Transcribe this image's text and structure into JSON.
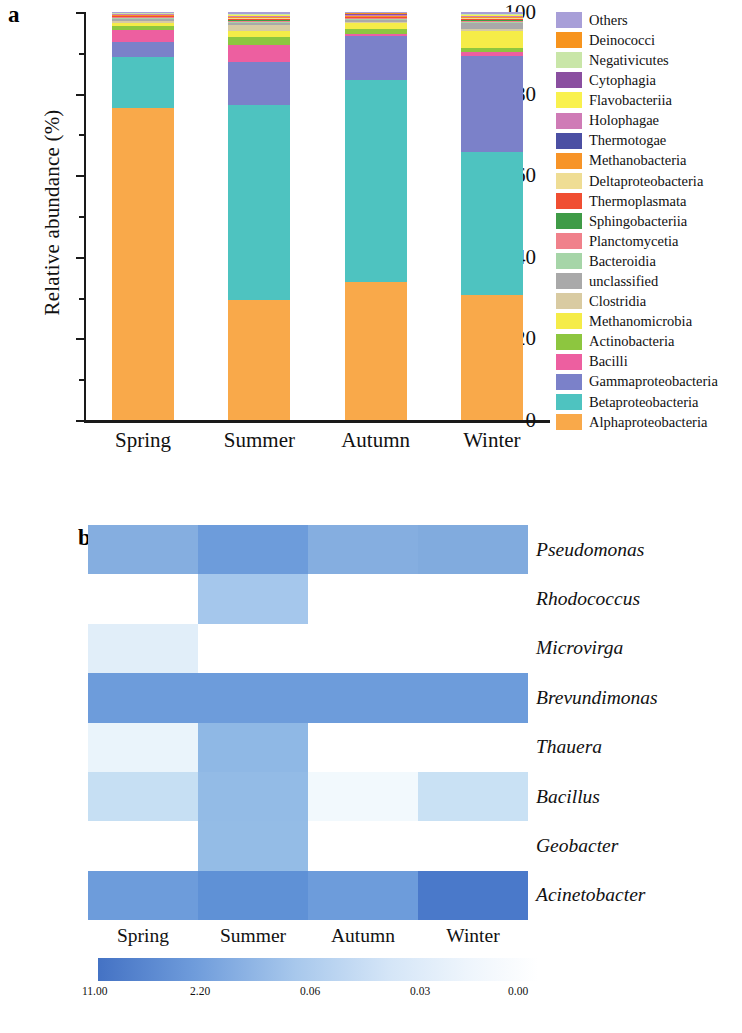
{
  "figure": {
    "panel_a_letter": "a",
    "panel_b_letter": "b"
  },
  "panel_a": {
    "y_axis_title": "Relative abundance (%)",
    "y_ticks": [
      "0",
      "20",
      "40",
      "60",
      "80",
      "100"
    ],
    "x_labels": [
      "Spring",
      "Summer",
      "Autumn",
      "Winter"
    ],
    "legend_title": ""
  },
  "legend": {
    "items": [
      {
        "label": "Others",
        "color": "#a89fd8"
      },
      {
        "label": "Deinococci",
        "color": "#f7941e"
      },
      {
        "label": "Negativicutes",
        "color": "#c9e6a8"
      },
      {
        "label": "Cytophagia",
        "color": "#8a4fa0"
      },
      {
        "label": "Flavobacteriia",
        "color": "#f9f14e"
      },
      {
        "label": "Holophagae",
        "color": "#cf7bb6"
      },
      {
        "label": "Thermotogae",
        "color": "#4b4fa3"
      },
      {
        "label": "Methanobacteria",
        "color": "#f79428"
      },
      {
        "label": "Deltaproteobacteria",
        "color": "#efdd94"
      },
      {
        "label": "Thermoplasmata",
        "color": "#f04e32"
      },
      {
        "label": "Sphingobacteriia",
        "color": "#3f9b47"
      },
      {
        "label": "Planctomycetia",
        "color": "#f0818b"
      },
      {
        "label": "Bacteroidia",
        "color": "#a6d5a8"
      },
      {
        "label": "unclassified",
        "color": "#a9a9a9"
      },
      {
        "label": "Clostridia",
        "color": "#d9cba2"
      },
      {
        "label": "Methanomicrobia",
        "color": "#f5ec48"
      },
      {
        "label": "Actinobacteria",
        "color": "#8dc63f"
      },
      {
        "label": "Bacilli",
        "color": "#ed5fa0"
      },
      {
        "label": "Gammaproteobacteria",
        "color": "#7b81c9"
      },
      {
        "label": "Betaproteobacteria",
        "color": "#4ec3c0"
      },
      {
        "label": "Alphaproteobacteria",
        "color": "#f9a94a"
      }
    ]
  },
  "chart_data": [
    {
      "type": "bar",
      "stacked": true,
      "title": "",
      "xlabel": "",
      "ylabel": "Relative abundance (%)",
      "ylim": [
        0,
        100
      ],
      "y_major_ticks": [
        0,
        20,
        40,
        60,
        80,
        100
      ],
      "y_minor_ticks": [
        10,
        30,
        50,
        70,
        90
      ],
      "grid": false,
      "legend_position": "right",
      "categories": [
        "Spring",
        "Summer",
        "Autumn",
        "Winter"
      ],
      "series": [
        {
          "name": "Alphaproteobacteria",
          "color": "#f9a94a",
          "values": [
            76.8,
            29.5,
            33.8,
            30.8
          ]
        },
        {
          "name": "Betaproteobacteria",
          "color": "#4ec3c0",
          "values": [
            12.6,
            48.0,
            49.5,
            35.3
          ]
        },
        {
          "name": "Gammaproteobacteria",
          "color": "#7b81c9",
          "values": [
            3.6,
            10.5,
            10.8,
            23.7
          ]
        },
        {
          "name": "Bacilli",
          "color": "#ed5fa0",
          "values": [
            3.0,
            4.2,
            0.7,
            0.9
          ]
        },
        {
          "name": "Actinobacteria",
          "color": "#8dc63f",
          "values": [
            0.9,
            1.9,
            1.2,
            1.1
          ]
        },
        {
          "name": "Methanomicrobia",
          "color": "#f5ec48",
          "values": [
            0.9,
            1.6,
            1.4,
            4.2
          ]
        },
        {
          "name": "Clostridia",
          "color": "#d9cba2",
          "values": [
            0.4,
            1.3,
            0.3,
            0.4
          ]
        },
        {
          "name": "unclassified",
          "color": "#a9a9a9",
          "values": [
            0.5,
            0.6,
            0.5,
            1.6
          ]
        },
        {
          "name": "Bacteroidia",
          "color": "#a6d5a8",
          "values": [
            0.2,
            0.3,
            0.2,
            0.2
          ]
        },
        {
          "name": "Planctomycetia",
          "color": "#f0818b",
          "values": [
            0.2,
            0.2,
            0.2,
            0.2
          ]
        },
        {
          "name": "Sphingobacteriia",
          "color": "#3f9b47",
          "values": [
            0.1,
            0.2,
            0.1,
            0.2
          ]
        },
        {
          "name": "Thermoplasmata",
          "color": "#f04e32",
          "values": [
            0.1,
            0.2,
            0.1,
            0.2
          ]
        },
        {
          "name": "Deltaproteobacteria",
          "color": "#efdd94",
          "values": [
            0.2,
            0.3,
            0.2,
            0.3
          ]
        },
        {
          "name": "Methanobacteria",
          "color": "#f79428",
          "values": [
            0.1,
            0.2,
            0.1,
            0.2
          ]
        },
        {
          "name": "Thermotogae",
          "color": "#4b4fa3",
          "values": [
            0.1,
            0.2,
            0.1,
            0.2
          ]
        },
        {
          "name": "Holophagae",
          "color": "#cf7bb6",
          "values": [
            0.1,
            0.2,
            0.1,
            0.2
          ]
        },
        {
          "name": "Flavobacteriia",
          "color": "#f9f14e",
          "values": [
            0.1,
            0.2,
            0.2,
            0.2
          ]
        },
        {
          "name": "Cytophagia",
          "color": "#8a4fa0",
          "values": [
            0.1,
            0.1,
            0.1,
            0.1
          ]
        },
        {
          "name": "Negativicutes",
          "color": "#c9e6a8",
          "values": [
            0.1,
            0.1,
            0.1,
            0.1
          ]
        },
        {
          "name": "Deinococci",
          "color": "#f7941e",
          "values": [
            0.1,
            0.1,
            0.1,
            0.1
          ]
        },
        {
          "name": "Others",
          "color": "#a89fd8",
          "values": [
            0.2,
            0.4,
            0.3,
            0.4
          ]
        }
      ]
    },
    {
      "type": "heatmap",
      "title": "",
      "xlabel": "",
      "ylabel": "",
      "columns": [
        "Spring",
        "Summer",
        "Autumn",
        "Winter"
      ],
      "rows": [
        "Pseudomonas",
        "Rhodococcus",
        "Microvirga",
        "Brevundimonas",
        "Thauera",
        "Bacillus",
        "Geobacter",
        "Acinetobacter"
      ],
      "values": [
        [
          0.3,
          0.9,
          0.3,
          0.4
        ],
        [
          0.0,
          0.1,
          0.0,
          0.0
        ],
        [
          0.03,
          0.0,
          0.0,
          0.0
        ],
        [
          0.8,
          1.2,
          0.8,
          0.8
        ],
        [
          0.02,
          0.45,
          0.0,
          0.0
        ],
        [
          0.06,
          0.4,
          0.01,
          0.03
        ],
        [
          0.0,
          0.35,
          0.0,
          0.0
        ],
        [
          0.8,
          1.1,
          0.9,
          2.2
        ]
      ],
      "colorbar": {
        "ticks": [
          "11.00",
          "2.20",
          "0.06",
          "0.03",
          "0.00"
        ],
        "low_color": "#4472c4",
        "high_color": "#ffffff",
        "orientation": "horizontal"
      }
    }
  ],
  "heatmap_cell_colors": [
    [
      "#85aee0",
      "#6d9cdb",
      "#85aee0",
      "#81abde"
    ],
    [
      "#ffffff",
      "#a5c7ec",
      "#ffffff",
      "#ffffff"
    ],
    [
      "#e1eef9",
      "#ffffff",
      "#ffffff",
      "#ffffff"
    ],
    [
      "#6d9cdb",
      "#6d9cdb",
      "#6d9cdb",
      "#6d9cdb"
    ],
    [
      "#eaf4fb",
      "#8fb8e5",
      "#ffffff",
      "#ffffff"
    ],
    [
      "#c6dff3",
      "#93bbe6",
      "#f2f9fd",
      "#c9e1f4"
    ],
    [
      "#ffffff",
      "#94bce6",
      "#ffffff",
      "#ffffff"
    ],
    [
      "#6d9cdb",
      "#5f91d6",
      "#6d9cdb",
      "#4a79ca"
    ]
  ],
  "colorbar_labels": [
    "11.00",
    "2.20",
    "0.06",
    "0.03",
    "0.00"
  ]
}
